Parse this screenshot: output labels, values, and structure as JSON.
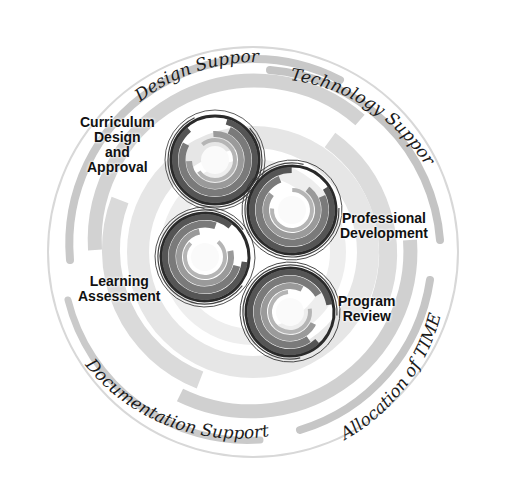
{
  "diagram": {
    "outer_labels": [
      {
        "id": "design-support",
        "text": "Design Support"
      },
      {
        "id": "technology-support",
        "text": "Technology Support"
      },
      {
        "id": "documentation-support",
        "text": "Documentation Support"
      },
      {
        "id": "allocation-of-time",
        "text": "Allocation of TIME"
      }
    ],
    "nodes": [
      {
        "id": "curriculum",
        "lines": [
          "Curriculum",
          "Design",
          "and",
          "Approval"
        ]
      },
      {
        "id": "professional",
        "lines": [
          "Professional",
          "Development"
        ]
      },
      {
        "id": "learning",
        "lines": [
          "Learning",
          "Assessment"
        ]
      },
      {
        "id": "program",
        "lines": [
          "Program",
          "Review"
        ]
      }
    ],
    "colors": {
      "ring_dark": "#2a2a2a",
      "ring_mid": "#6e6e6e",
      "swirl_light": "#c8c8c8",
      "swirl_pale": "#e4e4e4",
      "text": "#111111"
    }
  }
}
